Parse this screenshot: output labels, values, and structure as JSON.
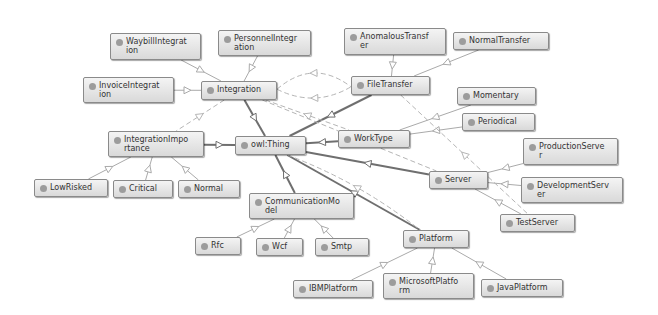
{
  "diagram": {
    "type": "ontology-class-graph",
    "root": "owl:Thing",
    "colors": {
      "node_fill_top": "#f4f4f4",
      "node_fill_bottom": "#d9d9d9",
      "node_border": "#8a8a8a",
      "dot": "#9c9c9c",
      "edge_strong": "#6f6f6f",
      "edge_light": "#aaaaaa",
      "edge_dashed": "#b5b5b5"
    },
    "nodes": [
      {
        "id": "thing",
        "label": "owl:Thing",
        "x": 235,
        "y": 136,
        "w": 71,
        "h": 19
      },
      {
        "id": "integration",
        "label": "Integration",
        "x": 201,
        "y": 81,
        "w": 76,
        "h": 19
      },
      {
        "id": "waybill",
        "label": "WaybillIntegrat\nion",
        "x": 110,
        "y": 33,
        "w": 91,
        "h": 27
      },
      {
        "id": "personnel",
        "label": "PersonnelIntegr\nation",
        "x": 218,
        "y": 30,
        "w": 93,
        "h": 26
      },
      {
        "id": "invoice",
        "label": "InvoiceIntegrat\nion",
        "x": 83,
        "y": 77,
        "w": 91,
        "h": 26
      },
      {
        "id": "importance",
        "label": "IntegrationImpo\nrtance",
        "x": 108,
        "y": 131,
        "w": 96,
        "h": 26
      },
      {
        "id": "lowrisked",
        "label": "LowRisked",
        "x": 34,
        "y": 179,
        "w": 74,
        "h": 18
      },
      {
        "id": "critical",
        "label": "Critical",
        "x": 113,
        "y": 180,
        "w": 60,
        "h": 18
      },
      {
        "id": "normal",
        "label": "Normal",
        "x": 178,
        "y": 180,
        "w": 62,
        "h": 18
      },
      {
        "id": "filetransfer",
        "label": "FileTransfer",
        "x": 351,
        "y": 76,
        "w": 79,
        "h": 19
      },
      {
        "id": "anomalous",
        "label": "AnomalousTransf\ner",
        "x": 344,
        "y": 28,
        "w": 102,
        "h": 27
      },
      {
        "id": "normaltransfer",
        "label": "NormalTransfer",
        "x": 453,
        "y": 32,
        "w": 96,
        "h": 18
      },
      {
        "id": "worktype",
        "label": "WorkType",
        "x": 338,
        "y": 130,
        "w": 72,
        "h": 18
      },
      {
        "id": "momentary",
        "label": "Momentary",
        "x": 457,
        "y": 87,
        "w": 79,
        "h": 18
      },
      {
        "id": "periodical",
        "label": "Periodical",
        "x": 462,
        "y": 113,
        "w": 73,
        "h": 18
      },
      {
        "id": "server",
        "label": "Server",
        "x": 429,
        "y": 171,
        "w": 59,
        "h": 18
      },
      {
        "id": "production",
        "label": "ProductionServe\nr",
        "x": 523,
        "y": 138,
        "w": 95,
        "h": 27
      },
      {
        "id": "development",
        "label": "DevelopmentServ\ner",
        "x": 521,
        "y": 177,
        "w": 102,
        "h": 26
      },
      {
        "id": "testserver",
        "label": "TestServer",
        "x": 500,
        "y": 214,
        "w": 75,
        "h": 18
      },
      {
        "id": "commmodel",
        "label": "CommunicationMo\ndel",
        "x": 249,
        "y": 193,
        "w": 105,
        "h": 26
      },
      {
        "id": "rfc",
        "label": "Rfc",
        "x": 195,
        "y": 237,
        "w": 46,
        "h": 18
      },
      {
        "id": "wcf",
        "label": "Wcf",
        "x": 256,
        "y": 238,
        "w": 47,
        "h": 18
      },
      {
        "id": "smtp",
        "label": "Smtp",
        "x": 315,
        "y": 238,
        "w": 54,
        "h": 18
      },
      {
        "id": "platform",
        "label": "Platform",
        "x": 403,
        "y": 230,
        "w": 66,
        "h": 18
      },
      {
        "id": "ibm",
        "label": "IBMPlatform",
        "x": 293,
        "y": 280,
        "w": 80,
        "h": 18
      },
      {
        "id": "microsoft",
        "label": "MicrosoftPlatfo\nrm",
        "x": 383,
        "y": 273,
        "w": 91,
        "h": 26
      },
      {
        "id": "java",
        "label": "JavaPlatform",
        "x": 481,
        "y": 279,
        "w": 82,
        "h": 18
      }
    ],
    "edges": [
      {
        "from": "thing",
        "to": "integration",
        "style": "strong"
      },
      {
        "from": "thing",
        "to": "importance",
        "style": "strong"
      },
      {
        "from": "thing",
        "to": "filetransfer",
        "style": "strong"
      },
      {
        "from": "thing",
        "to": "worktype",
        "style": "strong"
      },
      {
        "from": "thing",
        "to": "server",
        "style": "strong"
      },
      {
        "from": "thing",
        "to": "commmodel",
        "style": "strong"
      },
      {
        "from": "thing",
        "to": "platform",
        "style": "strong"
      },
      {
        "from": "integration",
        "to": "waybill",
        "style": "light"
      },
      {
        "from": "integration",
        "to": "personnel",
        "style": "light"
      },
      {
        "from": "integration",
        "to": "invoice",
        "style": "light"
      },
      {
        "from": "importance",
        "to": "lowrisked",
        "style": "light"
      },
      {
        "from": "importance",
        "to": "critical",
        "style": "light"
      },
      {
        "from": "importance",
        "to": "normal",
        "style": "light"
      },
      {
        "from": "filetransfer",
        "to": "anomalous",
        "style": "light"
      },
      {
        "from": "filetransfer",
        "to": "normaltransfer",
        "style": "light"
      },
      {
        "from": "worktype",
        "to": "momentary",
        "style": "light"
      },
      {
        "from": "worktype",
        "to": "periodical",
        "style": "light"
      },
      {
        "from": "server",
        "to": "production",
        "style": "light"
      },
      {
        "from": "server",
        "to": "development",
        "style": "light"
      },
      {
        "from": "server",
        "to": "testserver",
        "style": "light"
      },
      {
        "from": "commmodel",
        "to": "rfc",
        "style": "light"
      },
      {
        "from": "commmodel",
        "to": "wcf",
        "style": "light"
      },
      {
        "from": "commmodel",
        "to": "smtp",
        "style": "light"
      },
      {
        "from": "platform",
        "to": "ibm",
        "style": "light"
      },
      {
        "from": "platform",
        "to": "microsoft",
        "style": "light"
      },
      {
        "from": "platform",
        "to": "java",
        "style": "light"
      },
      {
        "from": "integration",
        "to": "filetransfer",
        "style": "dashed",
        "curve": -30
      },
      {
        "from": "integration",
        "to": "worktype",
        "style": "dashed",
        "curve": 0
      },
      {
        "from": "integration",
        "to": "server",
        "style": "dashed",
        "curve": 0
      },
      {
        "from": "integration",
        "to": "importance",
        "style": "dashed",
        "curve": 0
      },
      {
        "from": "integration",
        "to": "filetransfer",
        "style": "dashed",
        "curve": 20
      },
      {
        "from": "filetransfer",
        "to": "testserver",
        "style": "dashed",
        "curve": 0
      },
      {
        "from": "thing",
        "to": "platform",
        "style": "dashed",
        "curve": -12
      }
    ]
  }
}
